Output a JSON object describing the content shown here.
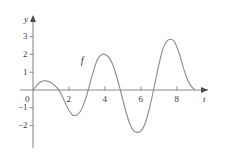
{
  "chart_data": {
    "type": "line",
    "title": "",
    "xlabel": "t",
    "ylabel": "y",
    "curve_label": "f",
    "xlim": [
      -0.9,
      9.9
    ],
    "ylim": [
      -2.75,
      3.35
    ],
    "grid": false,
    "legend_position": "none",
    "axis_color": "#8a8a8a",
    "curve_color": "#8a8a8a",
    "text_color": "#333333",
    "xticks": [
      2,
      4,
      6,
      8
    ],
    "xtick_labels": [
      "2",
      "4",
      "6",
      "8"
    ],
    "yticks": [
      -2,
      -1,
      1,
      2,
      3
    ],
    "ytick_labels": [
      "−2",
      "−1",
      "1",
      "2",
      "3"
    ],
    "origin_label": "0",
    "series": [
      {
        "name": "f",
        "description": "oscillation with growing amplitude, period 4, zeros at t = 0, 2, 4, 6, 8 (approx) and ending at t = 9",
        "x": [
          0.0,
          0.2,
          0.4,
          0.6,
          0.8,
          1.0,
          1.2,
          1.4,
          1.6,
          1.8,
          2.0,
          2.2,
          2.4,
          2.6,
          2.8,
          3.0,
          3.2,
          3.4,
          3.6,
          3.8,
          4.0,
          4.2,
          4.4,
          4.6,
          4.8,
          5.0,
          5.2,
          5.4,
          5.6,
          5.8,
          6.0,
          6.2,
          6.4,
          6.6,
          6.8,
          7.0,
          7.2,
          7.4,
          7.6,
          7.8,
          8.0,
          8.2,
          8.4,
          8.6,
          8.8,
          9.0
        ],
        "y": [
          0.0,
          0.25,
          0.44,
          0.52,
          0.5,
          0.42,
          0.26,
          0.05,
          -0.3,
          -0.75,
          -1.15,
          -1.4,
          -1.42,
          -1.25,
          -0.85,
          -0.25,
          0.5,
          1.2,
          1.75,
          1.98,
          2.0,
          1.85,
          1.5,
          0.9,
          0.2,
          -0.6,
          -1.35,
          -1.95,
          -2.3,
          -2.38,
          -2.3,
          -1.95,
          -1.3,
          -0.45,
          0.5,
          1.45,
          2.25,
          2.7,
          2.85,
          2.78,
          2.4,
          1.8,
          1.1,
          0.55,
          0.2,
          0.0
        ]
      }
    ],
    "annotations": [
      {
        "text": "f",
        "t": 3.15,
        "y": 1.55
      },
      {
        "text": "y",
        "position": "y-axis-top"
      },
      {
        "text": "t",
        "position": "x-axis-right"
      }
    ],
    "key_points": {
      "first_local_max": {
        "t": 0.6,
        "y": 0.52
      },
      "first_local_min": {
        "t": 2.3,
        "y": -1.42
      },
      "second_local_max": {
        "t": 4.0,
        "y": 2.0
      },
      "second_local_min": {
        "t": 5.85,
        "y": -2.38
      },
      "third_local_max": {
        "t": 7.65,
        "y": 2.85
      },
      "curve_end": {
        "t": 9.0,
        "y": 0.0
      }
    }
  }
}
